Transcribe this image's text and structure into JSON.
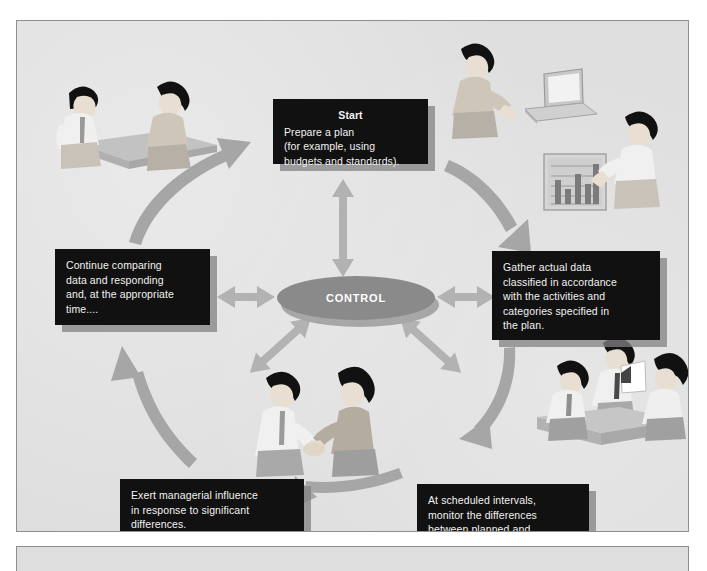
{
  "figure": {
    "type": "management-control-cycle-diagram",
    "center_label": "CONTROL",
    "background_color": "#dedede",
    "box_color": "#111111",
    "box_text_color": "#f2f2f2",
    "arrow_color": "#a0a0a0",
    "accent_color": "#8a8a8a"
  },
  "boxes": {
    "start": {
      "title": "Start",
      "lines": [
        "Prepare a plan",
        "(for example, using",
        "budgets and standards)."
      ]
    },
    "gather": {
      "title": "",
      "lines": [
        "Gather actual data",
        "classified in accordance",
        "with the activities and",
        "categories specified in",
        "the plan."
      ]
    },
    "monitor": {
      "title": "",
      "lines": [
        "At scheduled intervals,",
        "monitor the differences",
        "between planned and",
        "actual data."
      ]
    },
    "exert": {
      "title": "",
      "lines": [
        "Exert managerial influence",
        "in response to significant",
        "differences."
      ]
    },
    "continue": {
      "title": "",
      "lines": [
        "Continue comparing",
        "data and responding",
        "and, at the appropriate",
        "time...."
      ]
    }
  },
  "illustrations": [
    {
      "name": "two-people-at-table-planning",
      "position": "top-left"
    },
    {
      "name": "person-with-laptop-and-bar-chart",
      "position": "top-right"
    },
    {
      "name": "three-people-meeting-with-presenter",
      "position": "bottom-right"
    },
    {
      "name": "two-people-handshake",
      "position": "bottom-center"
    }
  ],
  "arrows": {
    "cycle": [
      {
        "name": "arrow-topleft-to-start",
        "style": "curved",
        "direction": "up-right"
      },
      {
        "name": "arrow-start-to-gather",
        "style": "curved",
        "direction": "down-right"
      },
      {
        "name": "arrow-gather-to-monitor",
        "style": "curved",
        "direction": "down-left"
      },
      {
        "name": "arrow-monitor-to-exert",
        "style": "curved",
        "direction": "left"
      },
      {
        "name": "arrow-exert-to-continue",
        "style": "curved",
        "direction": "up-left"
      }
    ],
    "spokes": [
      {
        "name": "arrow-control-to-start",
        "style": "double-headed",
        "direction": "up"
      },
      {
        "name": "arrow-control-to-gather",
        "style": "double-headed",
        "direction": "right"
      },
      {
        "name": "arrow-control-to-monitor",
        "style": "double-headed",
        "direction": "down-right"
      },
      {
        "name": "arrow-control-to-exert",
        "style": "double-headed",
        "direction": "down-left"
      },
      {
        "name": "arrow-control-to-continue",
        "style": "double-headed",
        "direction": "left"
      }
    ]
  },
  "chart_thumbnail": {
    "type": "bar",
    "bars": [
      0.55,
      0.3,
      0.7,
      0.42,
      0.95
    ],
    "gridlines": 5
  }
}
